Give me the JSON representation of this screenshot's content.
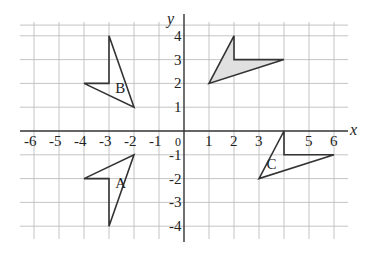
{
  "diagram": {
    "type": "coordinate-grid-transformations",
    "x_axis": {
      "label": "x",
      "ticks": [
        "-6",
        "-5",
        "-4",
        "-3",
        "-2",
        "-1",
        "0",
        "1",
        "2",
        "3",
        "5",
        "6"
      ],
      "range": [
        -6,
        6
      ]
    },
    "y_axis": {
      "label": "y",
      "ticks": [
        "4",
        "3",
        "2",
        "1",
        "-1",
        "-2",
        "-3",
        "-4"
      ],
      "range": [
        -4,
        4
      ]
    },
    "shapes": [
      {
        "name": "object",
        "label": "",
        "shaded": true,
        "fill": "#e0e0e0",
        "vertices": [
          [
            1,
            2
          ],
          [
            2,
            4
          ],
          [
            2,
            3
          ],
          [
            4,
            3
          ]
        ]
      },
      {
        "name": "B",
        "label": "B",
        "shaded": false,
        "fill": "none",
        "vertices": [
          [
            -2,
            1
          ],
          [
            -3,
            4
          ],
          [
            -3,
            2
          ],
          [
            -4,
            2
          ]
        ],
        "label_pos": [
          -2.75,
          1.8
        ]
      },
      {
        "name": "A",
        "label": "A",
        "shaded": false,
        "fill": "none",
        "vertices": [
          [
            -2,
            -1
          ],
          [
            -3,
            -4
          ],
          [
            -3,
            -2
          ],
          [
            -4,
            -2
          ]
        ],
        "label_pos": [
          -2.75,
          -2.2
        ]
      },
      {
        "name": "C",
        "label": "C",
        "shaded": false,
        "fill": "none",
        "vertices": [
          [
            3,
            -2
          ],
          [
            4,
            0
          ],
          [
            4,
            -1
          ],
          [
            6,
            -1
          ]
        ],
        "label_pos": [
          3.3,
          -1.4
        ]
      }
    ]
  }
}
